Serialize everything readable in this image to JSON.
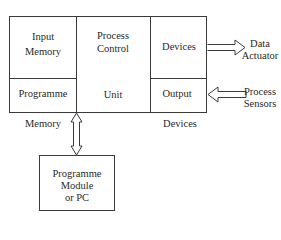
{
  "diagram": {
    "type": "block-diagram",
    "main_block": {
      "cells": {
        "input_memory": [
          "Input",
          "Memory"
        ],
        "process_control": [
          "Process",
          "Control"
        ],
        "devices_top": "Devices",
        "programme": "Programme",
        "unit": "Unit",
        "output": "Output"
      },
      "below_labels": {
        "memory": "Memory",
        "devices": "Devices"
      }
    },
    "external": {
      "data_actuator": [
        "Data",
        "Actuator"
      ],
      "process_sensors": [
        "Process",
        "Sensors"
      ]
    },
    "programme_module": [
      "Programme",
      "Module",
      "or PC"
    ],
    "arrows": [
      {
        "from": "devices_top",
        "to": "data_actuator",
        "direction": "right"
      },
      {
        "from": "process_sensors",
        "to": "output",
        "direction": "left"
      },
      {
        "between": "main_block",
        "and": "programme_module",
        "direction": "bidirectional-vertical"
      }
    ],
    "colors": {
      "line": "#3a3a3a",
      "background": "#ffffff"
    }
  }
}
